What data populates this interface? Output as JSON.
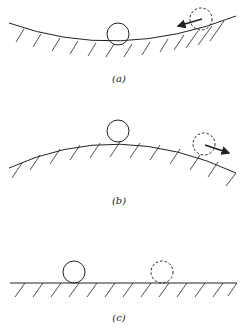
{
  "panels": [
    {
      "id": "a",
      "label": "(a)",
      "surface": "concave",
      "description": "Stable equilibrium: ball at bottom of a bowl; displaced ball rolls back toward center"
    },
    {
      "id": "b",
      "label": "(b)",
      "surface": "convex",
      "description": "Unstable equilibrium: ball on top of a hill; displaced ball rolls away"
    },
    {
      "id": "c",
      "label": "(c)",
      "surface": "flat",
      "description": "Neutral equilibrium: ball on flat surface; displaced ball stays in place"
    }
  ],
  "colors": {
    "stroke": "#222222",
    "background": "#ffffff"
  }
}
